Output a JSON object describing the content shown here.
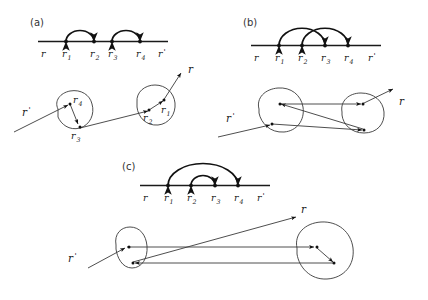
{
  "figure": {
    "background_color": "#ffffff",
    "ink_color": "#1a1a1a",
    "ray_color": "#3a3a3a",
    "width": 428,
    "height": 300
  },
  "labels": {
    "r": "r",
    "r_prime": "r",
    "prime_mark": "'",
    "sub1": "1",
    "sub2": "2",
    "sub3": "3",
    "sub4": "4"
  },
  "panels": [
    {
      "id": "a",
      "tag": "(a)",
      "description": "two separate non-overlapping arcs",
      "axis": {
        "start_label": "r",
        "end_label": "r'",
        "nodes": [
          "r1",
          "r2",
          "r3",
          "r4"
        ],
        "node_labels": [
          "r",
          "r",
          "r",
          "r"
        ],
        "node_subs": [
          "1",
          "2",
          "3",
          "4"
        ]
      },
      "arcs": [
        {
          "from": "r1",
          "to": "r2",
          "kind": "separate"
        },
        {
          "from": "r3",
          "to": "r4",
          "kind": "separate"
        }
      ],
      "scattering": {
        "in_label": "r'",
        "out_label": "r",
        "blobs": 2,
        "site_labels": [
          "r4",
          "r3",
          "r2",
          "r1"
        ],
        "site_subs": [
          "4",
          "3",
          "2",
          "1"
        ]
      }
    },
    {
      "id": "b",
      "tag": "(b)",
      "description": "two crossing (interleaved) arcs",
      "axis": {
        "start_label": "r",
        "end_label": "r'",
        "nodes": [
          "r1",
          "r2",
          "r3",
          "r4"
        ],
        "node_labels": [
          "r",
          "r",
          "r",
          "r"
        ],
        "node_subs": [
          "1",
          "2",
          "3",
          "4"
        ]
      },
      "arcs": [
        {
          "from": "r1",
          "to": "r3",
          "kind": "crossing"
        },
        {
          "from": "r2",
          "to": "r4",
          "kind": "crossing"
        }
      ],
      "scattering": {
        "in_label": "r'",
        "out_label": "r",
        "blobs": 2,
        "site_labels": [],
        "site_subs": []
      }
    },
    {
      "id": "c",
      "tag": "(c)",
      "description": "nested arcs",
      "axis": {
        "start_label": "r",
        "end_label": "r'",
        "nodes": [
          "r1",
          "r2",
          "r3",
          "r4"
        ],
        "node_labels": [
          "r",
          "r",
          "r",
          "r"
        ],
        "node_subs": [
          "1",
          "2",
          "3",
          "4"
        ]
      },
      "arcs": [
        {
          "from": "r1",
          "to": "r4",
          "kind": "nested-outer"
        },
        {
          "from": "r2",
          "to": "r3",
          "kind": "nested-inner"
        }
      ],
      "scattering": {
        "in_label": "r'",
        "out_label": "r",
        "blobs": 2,
        "site_labels": [],
        "site_subs": []
      }
    }
  ]
}
